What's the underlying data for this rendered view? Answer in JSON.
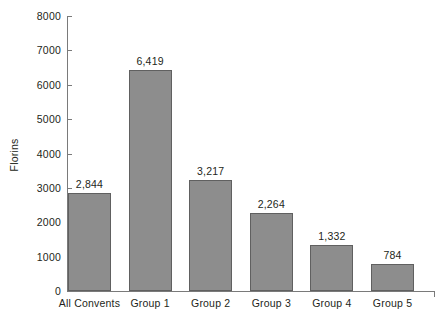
{
  "chart_data": {
    "type": "bar",
    "title": "",
    "xlabel": "",
    "ylabel": "Florins",
    "categories": [
      "All Convents",
      "Group 1",
      "Group 2",
      "Group 3",
      "Group 4",
      "Group 5"
    ],
    "values": [
      2844,
      6419,
      3217,
      2264,
      1332,
      784
    ],
    "value_labels": [
      "2,844",
      "6,419",
      "3,217",
      "2,264",
      "1,332",
      "784"
    ],
    "ylim": [
      0,
      8000
    ],
    "yticks": [
      0,
      1000,
      2000,
      3000,
      4000,
      5000,
      6000,
      7000,
      8000
    ],
    "ytick_labels": [
      "0",
      "1000",
      "2000",
      "3000",
      "4000",
      "5000",
      "6000",
      "7000",
      "8000"
    ],
    "grid": false,
    "legend": null,
    "legend_position": "none",
    "series": [
      {
        "name": "Florins",
        "values": [
          2844,
          6419,
          3217,
          2264,
          1332,
          784
        ]
      }
    ],
    "colors": {
      "bar_fill": "#8d8d8d",
      "bar_stroke": "#606060",
      "axis": "#7a7a7a",
      "text": "#231f20",
      "background": "#ffffff"
    }
  }
}
